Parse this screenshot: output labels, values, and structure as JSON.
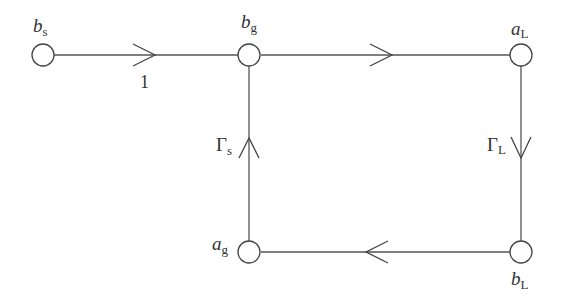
{
  "diagram": {
    "type": "signal-flow-graph",
    "nodes": [
      {
        "id": "bs",
        "label_main": "b",
        "label_sub": "s",
        "x": 43,
        "y": 55
      },
      {
        "id": "bg",
        "label_main": "b",
        "label_sub": "g",
        "x": 249,
        "y": 55
      },
      {
        "id": "aL",
        "label_main": "a",
        "label_sub": "L",
        "x": 521,
        "y": 55
      },
      {
        "id": "bL",
        "label_main": "b",
        "label_sub": "L",
        "x": 521,
        "y": 252
      },
      {
        "id": "ag",
        "label_main": "a",
        "label_sub": "g",
        "x": 249,
        "y": 252
      }
    ],
    "edges": [
      {
        "from": "bs",
        "to": "bg",
        "gain": "1",
        "direction": "right"
      },
      {
        "from": "bg",
        "to": "aL",
        "gain": "",
        "direction": "right"
      },
      {
        "from": "aL",
        "to": "bL",
        "gain_main": "Γ",
        "gain_sub": "L",
        "direction": "down"
      },
      {
        "from": "bL",
        "to": "ag",
        "gain": "",
        "direction": "left"
      },
      {
        "from": "ag",
        "to": "bg",
        "gain_main": "Γ",
        "gain_sub": "s",
        "direction": "up"
      }
    ]
  },
  "labels": {
    "bs_main": "b",
    "bs_sub": "s",
    "bg_main": "b",
    "bg_sub": "g",
    "aL_main": "a",
    "aL_sub": "L",
    "bL_main": "b",
    "bL_sub": "L",
    "ag_main": "a",
    "ag_sub": "g",
    "edge_bs_bg_gain": "1",
    "gamma_s_main": "Γ",
    "gamma_s_sub": "s",
    "gamma_L_main": "Γ",
    "gamma_L_sub": "L"
  }
}
